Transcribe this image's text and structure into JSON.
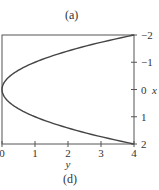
{
  "top_caption": "(a)",
  "bottom_caption": "(d)",
  "chart_data": {
    "type": "line",
    "title": "",
    "xlabel": "y",
    "ylabel": "x",
    "x_axis_position": "bottom",
    "y_axis_position": "right",
    "y_axis_inverted": true,
    "xlim": [
      0,
      4
    ],
    "ylim": [
      -2,
      2
    ],
    "x_ticks": [
      0,
      1,
      2,
      3,
      4
    ],
    "y_ticks": [
      -2,
      -1,
      0,
      1,
      2
    ],
    "x_tick_labels": [
      "0",
      "1",
      "2",
      "3",
      "4"
    ],
    "y_tick_labels": [
      "−2",
      "−1",
      "0",
      "1",
      "2"
    ],
    "grid": false,
    "legend": null,
    "series": [
      {
        "name": "y = x^2",
        "description": "Parabola opening rightward, vertex at (y=0, x=0)",
        "points": [
          {
            "y": 4.0,
            "x": -2.0
          },
          {
            "y": 2.25,
            "x": -1.5
          },
          {
            "y": 1.0,
            "x": -1.0
          },
          {
            "y": 0.25,
            "x": -0.5
          },
          {
            "y": 0.0,
            "x": 0.0
          },
          {
            "y": 0.25,
            "x": 0.5
          },
          {
            "y": 1.0,
            "x": 1.0
          },
          {
            "y": 2.25,
            "x": 1.5
          },
          {
            "y": 4.0,
            "x": 2.0
          }
        ]
      }
    ]
  },
  "colors": {
    "axis": "#555555",
    "curve": "#444444",
    "text": "#333333"
  }
}
